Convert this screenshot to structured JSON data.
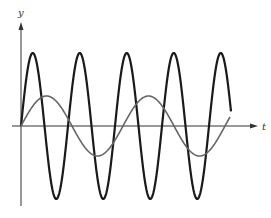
{
  "chart_data": {
    "type": "line",
    "title": "",
    "xlabel": "t",
    "ylabel": "y",
    "grid": false,
    "legend": null,
    "axes": {
      "origin_px": [
        21,
        126
      ],
      "x_axis_end_px": 258,
      "y_axis_top_px": 22,
      "y_axis_bottom_px": 206
    },
    "series": [
      {
        "name": "high-frequency wave",
        "color": "#1a1a1a",
        "stroke_width": 2.2,
        "function": "A*sin(2*pi*(t)/P)",
        "amplitude_px": 73,
        "period_px": 47,
        "phase_px": 0,
        "start_px": 21,
        "end_px": 231,
        "peaks_x_px": [
          33,
          80,
          127,
          174,
          221
        ],
        "troughs_x_px": [
          56,
          103,
          150,
          197
        ]
      },
      {
        "name": "low-frequency wave",
        "color": "#666666",
        "stroke_width": 1.6,
        "function": "A*sin(2*pi*(t)/P)",
        "amplitude_px": 30,
        "period_px": 102,
        "phase_px": 0,
        "start_px": 21,
        "end_px": 230,
        "peaks_x_px": [
          47,
          149
        ],
        "troughs_x_px": [
          98,
          200
        ]
      }
    ]
  },
  "labels": {
    "y_axis": "y",
    "t_axis": "t"
  },
  "colors": {
    "axis": "#333333",
    "background": "#ffffff"
  }
}
